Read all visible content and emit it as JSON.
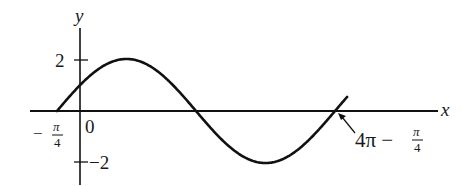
{
  "chart_data": {
    "type": "line",
    "title": "",
    "function": "y = 2 sin((x + π/4)/2)",
    "xlabel": "x",
    "ylabel": "y",
    "x_start": -0.7853981634,
    "x_end": 11.780972451,
    "amplitude": 2,
    "period": 12.566370614,
    "phase_shift": -0.7853981634,
    "y_ticks": [
      {
        "value": 2,
        "label": "2"
      },
      {
        "value": -2,
        "label": "−2"
      }
    ],
    "annotations": {
      "left_root_num": "π",
      "left_root_den": "4",
      "left_root_sign": "−",
      "origin": "0",
      "right_root_prefix": "4π −",
      "right_root_num": "π",
      "right_root_den": "4"
    },
    "ylim": [
      -2.5,
      3
    ],
    "grid": false,
    "legend": "none"
  }
}
